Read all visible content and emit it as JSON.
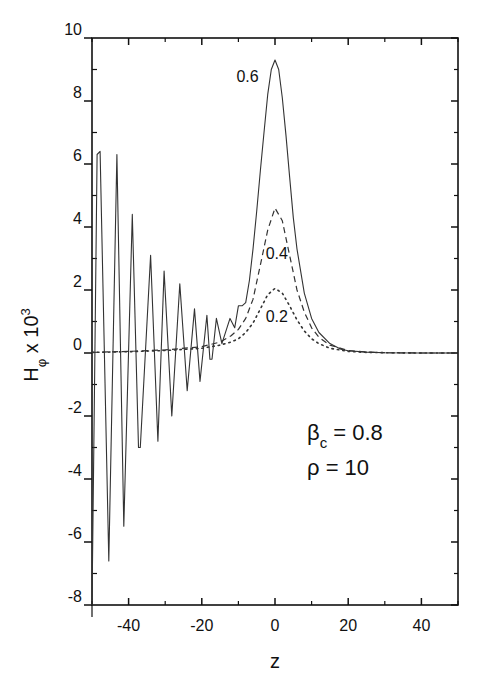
{
  "chart_data": {
    "type": "line",
    "title": "",
    "xlabel": "z",
    "ylabel": "H_phi x 10^3",
    "ylabel_parts": {
      "main": "H",
      "sub": "φ",
      "mid": " x 10",
      "sup": "3"
    },
    "xlim": [
      -50,
      50
    ],
    "ylim": [
      -8,
      10
    ],
    "x_ticks_major": [
      -40,
      -20,
      0,
      20,
      40
    ],
    "x_ticks_minor": [
      -50,
      -30,
      -10,
      10,
      30,
      50
    ],
    "y_ticks_major": [
      -8,
      -6,
      -4,
      -2,
      0,
      2,
      4,
      6,
      8,
      10
    ],
    "y_ticks_minor": [
      -7,
      -5,
      -3,
      -1,
      1,
      3,
      5,
      7,
      9
    ],
    "x_tick_labels": [
      "-40",
      "-20",
      "0",
      "20",
      "40"
    ],
    "y_tick_labels": [
      "-8",
      "-6",
      "-4",
      "-2",
      "0",
      "2",
      "4",
      "6",
      "8",
      "10"
    ],
    "grid": false,
    "legend": "none (inline curve labels)",
    "annotations": [
      {
        "text": "0.6",
        "z": -7.5,
        "y": 8.6
      },
      {
        "text": "0.4",
        "z": 0.5,
        "y": 3.0
      },
      {
        "text": "0.2",
        "z": 0.5,
        "y": 1.0
      }
    ],
    "parameters": [
      {
        "symbol": "β",
        "sub": "c",
        "text": " = 0.8"
      },
      {
        "symbol": "ρ",
        "sub": "",
        "text": " = 10"
      }
    ],
    "series": [
      {
        "name": "0.6",
        "style": "solid",
        "x": [
          -50,
          -49.2,
          -48.6,
          -47.8,
          -45.4,
          -43.2,
          -41.3,
          -39.0,
          -37.3,
          -36.8,
          -34.0,
          -32.0,
          -30.3,
          -28.2,
          -26.0,
          -24.0,
          -22.0,
          -20.5,
          -18.6,
          -17.8,
          -17.2,
          -16.0,
          -14.5,
          -12.3,
          -11.0,
          -10.0,
          -9.0,
          -8.0,
          -7.0,
          -6.0,
          -5.0,
          -4.0,
          -3.0,
          -2.0,
          -1.0,
          0.0,
          1.0,
          2.0,
          3.0,
          4.0,
          5.0,
          6.0,
          8.0,
          10.0,
          12.0,
          15.0,
          18.0,
          20.0,
          25.0,
          30.0,
          40.0,
          50.0
        ],
        "values": [
          -8.0,
          0.0,
          6.3,
          6.4,
          -6.6,
          6.3,
          -5.5,
          4.4,
          -3.0,
          -3.0,
          3.1,
          -2.8,
          2.6,
          -2.0,
          2.2,
          -1.2,
          1.4,
          -0.9,
          1.2,
          -0.2,
          -0.2,
          1.1,
          0.3,
          1.1,
          0.8,
          1.5,
          1.5,
          1.6,
          2.3,
          3.3,
          4.5,
          5.8,
          7.0,
          8.2,
          9.0,
          9.3,
          9.0,
          8.1,
          6.9,
          5.6,
          4.3,
          3.3,
          1.9,
          1.1,
          0.65,
          0.3,
          0.12,
          0.07,
          0.03,
          0.01,
          0.0,
          0.0
        ]
      },
      {
        "name": "0.4",
        "style": "dashed",
        "x": [
          -50,
          -40,
          -30,
          -20,
          -15,
          -12,
          -10,
          -8,
          -6,
          -4,
          -2,
          0,
          2,
          4,
          6,
          8,
          10,
          12,
          15,
          20,
          25,
          30,
          40,
          50
        ],
        "values": [
          0.02,
          0.05,
          0.1,
          0.2,
          0.35,
          0.55,
          0.75,
          1.1,
          1.7,
          2.8,
          3.9,
          4.6,
          4.2,
          3.1,
          2.0,
          1.3,
          0.8,
          0.5,
          0.25,
          0.08,
          0.03,
          0.01,
          0.0,
          0.0
        ]
      },
      {
        "name": "0.2",
        "style": "dotted",
        "x": [
          -50,
          -40,
          -30,
          -20,
          -15,
          -12,
          -10,
          -8,
          -6,
          -4,
          -2,
          0,
          2,
          4,
          6,
          8,
          10,
          12,
          15,
          20,
          25,
          30,
          40,
          50
        ],
        "values": [
          0.02,
          0.04,
          0.08,
          0.15,
          0.25,
          0.35,
          0.45,
          0.65,
          0.95,
          1.4,
          1.85,
          2.05,
          1.9,
          1.5,
          1.05,
          0.7,
          0.45,
          0.3,
          0.15,
          0.05,
          0.02,
          0.01,
          0.0,
          0.0
        ]
      }
    ]
  }
}
